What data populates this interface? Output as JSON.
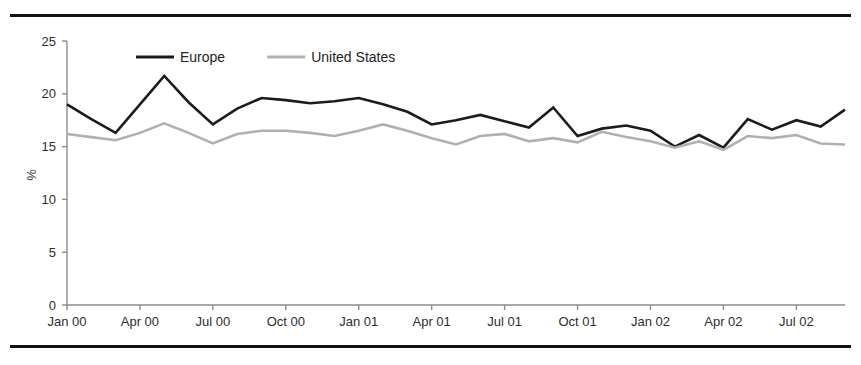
{
  "figure": {
    "top_rule": "top-border-rule",
    "bottom_rule": "bottom-border-rule"
  },
  "chart_data": {
    "type": "line",
    "title": "",
    "xlabel": "",
    "ylabel": "%",
    "ylim": [
      0,
      25
    ],
    "yticks": [
      0,
      5,
      10,
      15,
      20,
      25
    ],
    "ytick_labels": [
      "0",
      "5",
      "10",
      "15",
      "20",
      "25"
    ],
    "grid": false,
    "legend_position": "top-center-inside",
    "xtick_labels": [
      "Jan 00",
      "Apr 00",
      "Jul 00",
      "Oct 00",
      "Jan 01",
      "Apr 01",
      "Jul 01",
      "Oct 01",
      "Jan 02",
      "Apr 02",
      "Jul 02"
    ],
    "x": [
      "Jan 00",
      "Feb 00",
      "Mar 00",
      "Apr 00",
      "May 00",
      "Jun 00",
      "Jul 00",
      "Aug 00",
      "Sep 00",
      "Oct 00",
      "Nov 00",
      "Dec 00",
      "Jan 01",
      "Feb 01",
      "Mar 01",
      "Apr 01",
      "May 01",
      "Jun 01",
      "Jul 01",
      "Aug 01",
      "Sep 01",
      "Oct 01",
      "Nov 01",
      "Dec 01",
      "Jan 02",
      "Feb 02",
      "Mar 02",
      "Apr 02",
      "May 02",
      "Jun 02",
      "Jul 02",
      "Aug 02",
      "Sep 02"
    ],
    "series": [
      {
        "name": "Europe",
        "color": "#1c1c1c",
        "width": 2.6,
        "values": [
          19.0,
          17.6,
          16.3,
          19.0,
          21.7,
          19.2,
          17.1,
          18.6,
          19.6,
          19.4,
          19.1,
          19.3,
          19.6,
          19.0,
          18.3,
          17.1,
          17.5,
          18.0,
          17.4,
          16.8,
          18.7,
          16.0,
          16.7,
          17.0,
          16.5,
          15.0,
          16.1,
          14.9,
          17.6,
          16.6,
          17.5,
          16.9,
          18.5
        ]
      },
      {
        "name": "United States",
        "color": "#b0b0b0",
        "width": 2.6,
        "values": [
          16.2,
          15.9,
          15.6,
          16.3,
          17.2,
          16.3,
          15.3,
          16.2,
          16.5,
          16.5,
          16.3,
          16.0,
          16.5,
          17.1,
          16.5,
          15.8,
          15.2,
          16.0,
          16.2,
          15.5,
          15.8,
          15.4,
          16.4,
          15.9,
          15.5,
          14.9,
          15.5,
          14.7,
          16.0,
          15.8,
          16.1,
          15.3,
          15.2
        ]
      }
    ],
    "tail": {
      "note": "series continue to Sep 02 converging near 15.2",
      "europe_end": 15.2,
      "us_end": 15.2
    },
    "legend": [
      {
        "label": "Europe",
        "color": "#1c1c1c"
      },
      {
        "label": "United States",
        "color": "#b0b0b0"
      }
    ]
  }
}
